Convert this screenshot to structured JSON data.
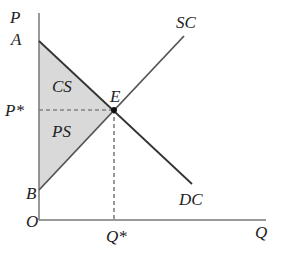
{
  "diagram": {
    "axes": {
      "y_label": "P",
      "x_label": "Q",
      "origin_label": "O"
    },
    "curves": {
      "supply_label": "SC",
      "demand_label": "DC"
    },
    "points": {
      "a_label": "A",
      "b_label": "B",
      "equilibrium_label": "E",
      "price_star_label": "P*",
      "quantity_star_label": "Q*"
    },
    "regions": {
      "consumer_surplus_label": "CS",
      "producer_surplus_label": "PS"
    },
    "colors": {
      "axis": "#777777",
      "curve": "#333333",
      "shade": "#d9d9d9",
      "dashed": "#555555",
      "text": "#222222"
    }
  }
}
